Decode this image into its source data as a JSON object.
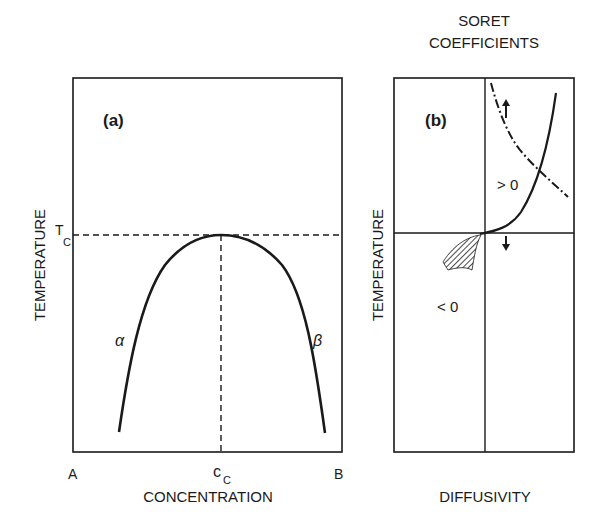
{
  "panel_a": {
    "label": "(a)",
    "ylabel": "TEMPERATURE",
    "xlabel": "CONCENTRATION",
    "x_left": "A",
    "x_right": "B",
    "x_mid_main": "c",
    "x_mid_sub": "C",
    "y_mark_main": "T",
    "y_mark_sub": "C",
    "phase_left": "α",
    "phase_right": "β"
  },
  "panel_b": {
    "title_line1": "SORET",
    "title_line2": "COEFFICIENTS",
    "label": "(b)",
    "ylabel": "TEMPERATURE",
    "xlabel": "DIFFUSIVITY",
    "positive_label": "> 0",
    "negative_label": "< 0"
  },
  "colors": {
    "ink": "#1a1a1a",
    "background": "#ffffff"
  }
}
